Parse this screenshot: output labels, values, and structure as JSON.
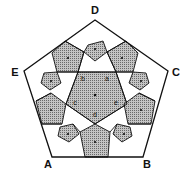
{
  "diagram": {
    "type": "pentagon-tiling",
    "outer_vertices": [
      {
        "label": "D",
        "x": 95,
        "y": 20,
        "lx": 95,
        "ly": 14
      },
      {
        "label": "C",
        "x": 168,
        "y": 71,
        "lx": 176,
        "ly": 76
      },
      {
        "label": "B",
        "x": 143,
        "y": 157,
        "lx": 147,
        "ly": 168
      },
      {
        "label": "A",
        "x": 52,
        "y": 157,
        "lx": 48,
        "ly": 168
      },
      {
        "label": "E",
        "x": 24,
        "y": 71,
        "lx": 15,
        "ly": 76
      }
    ],
    "center_labels": [
      {
        "label": "b",
        "x": 83,
        "y": 81
      },
      {
        "label": "a",
        "x": 107,
        "y": 81
      },
      {
        "label": "c",
        "x": 75,
        "y": 105
      },
      {
        "label": "e",
        "x": 116,
        "y": 105
      },
      {
        "label": "d",
        "x": 95,
        "y": 117
      }
    ],
    "colors": {
      "stroke": "#111111",
      "shade": "#a8a8a8",
      "background": "#ffffff"
    }
  }
}
